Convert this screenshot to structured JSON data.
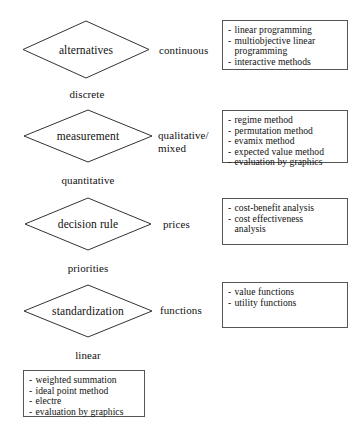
{
  "diagram": {
    "type": "decision-flowchart",
    "nodes": [
      {
        "id": "alternatives",
        "label": "alternatives",
        "shape": "diamond"
      },
      {
        "id": "measurement",
        "label": "measurement",
        "shape": "diamond"
      },
      {
        "id": "decision-rule",
        "label": "decision rule",
        "shape": "diamond"
      },
      {
        "id": "standardization",
        "label": "standardization",
        "shape": "diamond"
      }
    ],
    "branch_labels": {
      "discrete": "discrete",
      "quantitative": "quantitative",
      "priorities": "priorities",
      "linear": "linear"
    },
    "edge_labels": {
      "continuous": "continuous",
      "qualitative_mixed_line1": "qualitative/",
      "qualitative_mixed_line2": "mixed",
      "prices": "prices",
      "functions": "functions"
    },
    "method_boxes": [
      {
        "id": "continuous-methods",
        "items": [
          {
            "text": "linear programming",
            "continuation": false
          },
          {
            "text": "multiobjective linear",
            "continuation": false
          },
          {
            "text": "programming",
            "continuation": true
          },
          {
            "text": "interactive methods",
            "continuation": false
          }
        ]
      },
      {
        "id": "qualitative-mixed-methods",
        "items": [
          {
            "text": "regime method",
            "continuation": false
          },
          {
            "text": "permutation method",
            "continuation": false
          },
          {
            "text": "evamix method",
            "continuation": false
          },
          {
            "text": "expected value method",
            "continuation": false
          },
          {
            "text": "evaluation by graphics",
            "continuation": false
          }
        ]
      },
      {
        "id": "prices-methods",
        "items": [
          {
            "text": "cost-benefit analysis",
            "continuation": false
          },
          {
            "text": "cost effectiveness",
            "continuation": false
          },
          {
            "text": "analysis",
            "continuation": true
          }
        ]
      },
      {
        "id": "functions-methods",
        "items": [
          {
            "text": "value functions",
            "continuation": false
          },
          {
            "text": "utility functions",
            "continuation": false
          }
        ]
      },
      {
        "id": "linear-methods",
        "items": [
          {
            "text": "weighted summation",
            "continuation": false
          },
          {
            "text": "ideal point method",
            "continuation": false
          },
          {
            "text": "electre",
            "continuation": false
          },
          {
            "text": "evaluation by graphics",
            "continuation": false
          }
        ]
      }
    ],
    "colors": {
      "stroke": "#333333",
      "box_border": "#555555",
      "text": "#111111",
      "background": "#ffffff"
    }
  }
}
